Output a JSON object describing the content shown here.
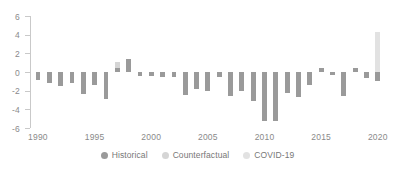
{
  "chart_data": {
    "type": "bar",
    "title": "",
    "subtitle": "",
    "xlabel": "",
    "ylabel": "",
    "xlim": [
      1989.3,
      2020.9
    ],
    "ylim": [
      -6,
      6
    ],
    "ytick_labels": [
      "6",
      "4",
      "2",
      "0",
      "-2",
      "-4",
      "-6"
    ],
    "yticks": [
      6,
      4,
      2,
      0,
      -2,
      -4,
      -6
    ],
    "xtick_labels": [
      "1990",
      "1995",
      "2000",
      "2005",
      "2010",
      "2015",
      "2020"
    ],
    "xticks": [
      1990,
      1995,
      2000,
      2005,
      2010,
      2015,
      2020
    ],
    "grid": false,
    "legend_position": "bottom-center",
    "legend": [
      {
        "name": "Historical",
        "color": "#9a9a9a"
      },
      {
        "name": "Counterfactual",
        "color": "#d5d5d5"
      },
      {
        "name": "COVID-19",
        "color": "#e2e2e2"
      }
    ],
    "series": [
      {
        "name": "Historical",
        "color": "#9a9a9a",
        "x": [
          1990,
          1991,
          1992,
          1993,
          1994,
          1995,
          1996,
          1997,
          1998,
          1999,
          2000,
          2001,
          2002,
          2003,
          2004,
          2005,
          2006,
          2007,
          2008,
          2009,
          2010,
          2011,
          2012,
          2013,
          2014,
          2015,
          2016,
          2017,
          2018,
          2019,
          2020
        ],
        "values": [
          -0.9,
          -1.2,
          -1.5,
          -1.2,
          -2.4,
          -1.4,
          -2.9,
          0.4,
          1.4,
          -0.4,
          -0.4,
          -0.5,
          -0.5,
          -2.5,
          -1.8,
          -2.0,
          -0.5,
          -2.6,
          -2.0,
          -3.1,
          -5.3,
          -5.2,
          -2.2,
          -2.7,
          -1.4,
          0.4,
          -0.3,
          -2.6,
          0.4,
          -0.6,
          -1.0
        ]
      },
      {
        "name": "Counterfactual",
        "color": "#d5d5d5",
        "x": [
          1997,
          2015,
          2018
        ],
        "values": [
          1.1,
          0.0,
          0.0
        ]
      },
      {
        "name": "COVID-19",
        "color": "#e2e2e2",
        "x": [
          2020
        ],
        "values": [
          4.3
        ]
      }
    ],
    "bar_width_years": 0.42
  },
  "axis": {
    "spine_color": "#c9c9c9",
    "tick_color": "#c9c9c9",
    "label_color": "#8a8a8a"
  }
}
